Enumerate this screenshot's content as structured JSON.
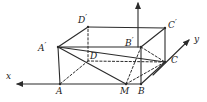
{
  "figure": {
    "stroke_color": "#2b2b2b",
    "background": "#ffffff",
    "solid_width": 1.1,
    "dash_width": 1.0,
    "dash_pattern": "2.2,2.0"
  },
  "axes": {
    "x": {
      "label": "x",
      "label_x": 6,
      "label_y": 72,
      "from_x": 60,
      "from_y": 84,
      "to_x": 17,
      "to_y": 84,
      "direction": "left"
    },
    "y": {
      "label": "y",
      "label_x": 194,
      "label_y": 35,
      "from_x": 153,
      "from_y": 75,
      "to_x": 189,
      "to_y": 40,
      "direction": "up-right"
    },
    "z": {
      "label": "",
      "from_x": 138,
      "from_y": 47,
      "to_x": 138,
      "to_y": 3,
      "direction": "up"
    }
  },
  "vertices": [
    {
      "name": "A",
      "label": "A",
      "x": 60,
      "y": 84,
      "label_x": 56,
      "label_y": 87,
      "hidden": false
    },
    {
      "name": "B",
      "label": "B",
      "x": 141,
      "y": 84,
      "label_x": 138,
      "label_y": 87,
      "hidden": false
    },
    {
      "name": "M",
      "label": "M",
      "x": 126,
      "y": 84,
      "label_x": 120,
      "label_y": 87,
      "hidden": false
    },
    {
      "name": "C",
      "label": "C",
      "x": 165,
      "y": 62,
      "label_x": 171,
      "label_y": 56,
      "hidden": false
    },
    {
      "name": "D",
      "label": "D",
      "x": 88,
      "y": 61,
      "label_x": 90,
      "label_y": 52,
      "hidden": true
    },
    {
      "name": "Ap",
      "label": "A",
      "prime": "′",
      "x": 58,
      "y": 47,
      "label_x": 38,
      "label_y": 41,
      "hidden": false
    },
    {
      "name": "Bp",
      "label": "B",
      "prime": "′",
      "x": 141,
      "y": 47,
      "label_x": 125,
      "label_y": 36,
      "hidden": false
    },
    {
      "name": "Cp",
      "label": "C",
      "prime": "′",
      "x": 165,
      "y": 28,
      "label_x": 168,
      "label_y": 18,
      "hidden": false
    },
    {
      "name": "Dp",
      "label": "D",
      "prime": "′",
      "x": 88,
      "y": 27,
      "label_x": 78,
      "label_y": 13,
      "hidden": false
    }
  ],
  "edges": [
    {
      "name": "A-B",
      "from": [
        60,
        84
      ],
      "to": [
        141,
        84
      ],
      "style": "solid"
    },
    {
      "name": "B-C",
      "from": [
        141,
        84
      ],
      "to": [
        165,
        62
      ],
      "style": "solid"
    },
    {
      "name": "C-D",
      "from": [
        165,
        62
      ],
      "to": [
        88,
        61
      ],
      "style": "dashed"
    },
    {
      "name": "D-A",
      "from": [
        88,
        61
      ],
      "to": [
        60,
        84
      ],
      "style": "dashed"
    },
    {
      "name": "Ap-Bp",
      "from": [
        58,
        47
      ],
      "to": [
        141,
        47
      ],
      "style": "solid"
    },
    {
      "name": "Bp-Cp",
      "from": [
        141,
        47
      ],
      "to": [
        165,
        28
      ],
      "style": "solid"
    },
    {
      "name": "Cp-Dp",
      "from": [
        165,
        28
      ],
      "to": [
        88,
        27
      ],
      "style": "solid"
    },
    {
      "name": "Dp-Ap",
      "from": [
        88,
        27
      ],
      "to": [
        58,
        47
      ],
      "style": "solid"
    },
    {
      "name": "A-Ap",
      "from": [
        60,
        84
      ],
      "to": [
        58,
        47
      ],
      "style": "solid"
    },
    {
      "name": "B-Bp",
      "from": [
        141,
        84
      ],
      "to": [
        141,
        47
      ],
      "style": "solid"
    },
    {
      "name": "C-Cp",
      "from": [
        165,
        62
      ],
      "to": [
        165,
        28
      ],
      "style": "solid"
    },
    {
      "name": "D-Dp",
      "from": [
        88,
        61
      ],
      "to": [
        88,
        27
      ],
      "style": "dashed"
    }
  ],
  "construction_lines": [
    {
      "name": "Ap-M",
      "from": [
        58,
        47
      ],
      "to": [
        126,
        84
      ],
      "style": "solid"
    },
    {
      "name": "Ap-C",
      "from": [
        58,
        47
      ],
      "to": [
        165,
        62
      ],
      "style": "solid"
    },
    {
      "name": "M-Bp",
      "from": [
        126,
        84
      ],
      "to": [
        141,
        47
      ],
      "style": "dashed"
    },
    {
      "name": "M-C",
      "from": [
        126,
        84
      ],
      "to": [
        165,
        62
      ],
      "style": "dashed"
    },
    {
      "name": "Bp-C",
      "from": [
        141,
        47
      ],
      "to": [
        165,
        62
      ],
      "style": "dashed"
    }
  ]
}
